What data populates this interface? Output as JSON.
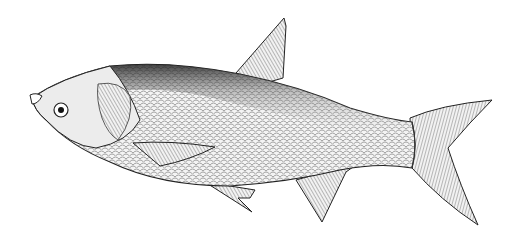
{
  "image": {
    "subject": "fish illustration",
    "style": "black and white pen-and-ink stipple drawing",
    "orientation": "facing left",
    "background": "#ffffff",
    "ink": "#1a1a1a"
  }
}
